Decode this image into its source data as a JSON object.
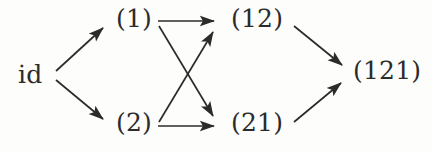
{
  "figure": {
    "background_color": "#fdfdfb",
    "ink_color": "#2b2b2b"
  },
  "nodes": [
    {
      "id": "id",
      "label": "id",
      "x": 33,
      "y": 75
    },
    {
      "id": "w1",
      "label": "(1)",
      "x": 134,
      "y": 19
    },
    {
      "id": "w2",
      "label": "(2)",
      "x": 134,
      "y": 123
    },
    {
      "id": "w12",
      "label": "(12)",
      "x": 255,
      "y": 19
    },
    {
      "id": "w21",
      "label": "(21)",
      "x": 255,
      "y": 123
    },
    {
      "id": "w121",
      "label": "(121)",
      "x": 390,
      "y": 73
    }
  ],
  "edges": [
    {
      "name": "id-to-1",
      "from": "id",
      "to": "w1",
      "x1": 56,
      "y1": 71,
      "x2": 103,
      "y2": 28,
      "kind": "diagonal-up"
    },
    {
      "name": "id-to-2",
      "from": "id",
      "to": "w2",
      "x1": 56,
      "y1": 80,
      "x2": 103,
      "y2": 119,
      "kind": "diagonal-down"
    },
    {
      "name": "1-to-12",
      "from": "w1",
      "to": "w12",
      "x1": 158,
      "y1": 21,
      "x2": 214,
      "y2": 21,
      "kind": "horizontal"
    },
    {
      "name": "2-to-21",
      "from": "w2",
      "to": "w21",
      "x1": 158,
      "y1": 126,
      "x2": 214,
      "y2": 126,
      "kind": "horizontal"
    },
    {
      "name": "1-to-21",
      "from": "w1",
      "to": "w21",
      "x1": 159,
      "y1": 26,
      "x2": 213,
      "y2": 116,
      "kind": "cross-down"
    },
    {
      "name": "2-to-12",
      "from": "w2",
      "to": "w12",
      "x1": 159,
      "y1": 122,
      "x2": 213,
      "y2": 32,
      "kind": "cross-up"
    },
    {
      "name": "12-to-121",
      "from": "w12",
      "to": "w121",
      "x1": 294,
      "y1": 26,
      "x2": 342,
      "y2": 65,
      "kind": "diagonal-down"
    },
    {
      "name": "21-to-121",
      "from": "w21",
      "to": "w121",
      "x1": 294,
      "y1": 122,
      "x2": 341,
      "y2": 83,
      "kind": "diagonal-up"
    }
  ]
}
